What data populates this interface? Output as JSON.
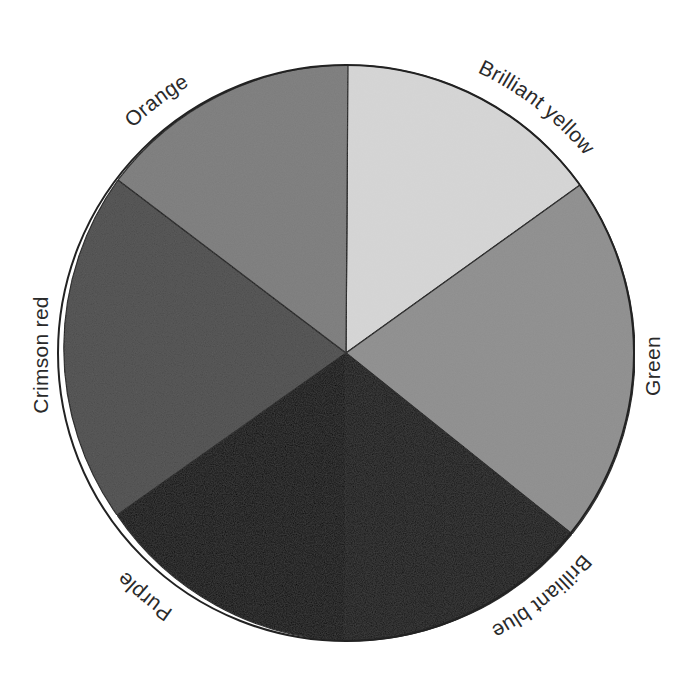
{
  "diagram": {
    "type": "color-wheel",
    "center": [
      346,
      353
    ],
    "radius": 288,
    "segments": [
      {
        "name": "Brilliant yellow",
        "start_deg": 90,
        "end_deg": 35.7,
        "gray": "#d4d4d4",
        "label_pos": "upper-right"
      },
      {
        "name": "Green",
        "start_deg": 35.7,
        "end_deg": -38.9,
        "gray": "#8c8c8c",
        "label_pos": "right"
      },
      {
        "name": "Brilliant blue",
        "start_deg": -38.9,
        "end_deg": -90,
        "gray": "#141414",
        "label_pos": "lower-right"
      },
      {
        "name": "Purple",
        "start_deg": -90,
        "end_deg": -144.4,
        "gray": "#0c0c0c",
        "label_pos": "lower-left"
      },
      {
        "name": "Crimson red",
        "start_deg": 215.6,
        "end_deg": 142.6,
        "gray": "#4a4a4a",
        "label_pos": "left"
      },
      {
        "name": "Orange",
        "start_deg": 142.6,
        "end_deg": 90,
        "gray": "#7a7a7a",
        "label_pos": "upper-left"
      }
    ]
  },
  "labels": {
    "yellow": "Brilliant yellow",
    "green": "Green",
    "blue": "Brilliant blue",
    "purple": "Purple",
    "crimson": "Crimson red",
    "orange": "Orange"
  }
}
